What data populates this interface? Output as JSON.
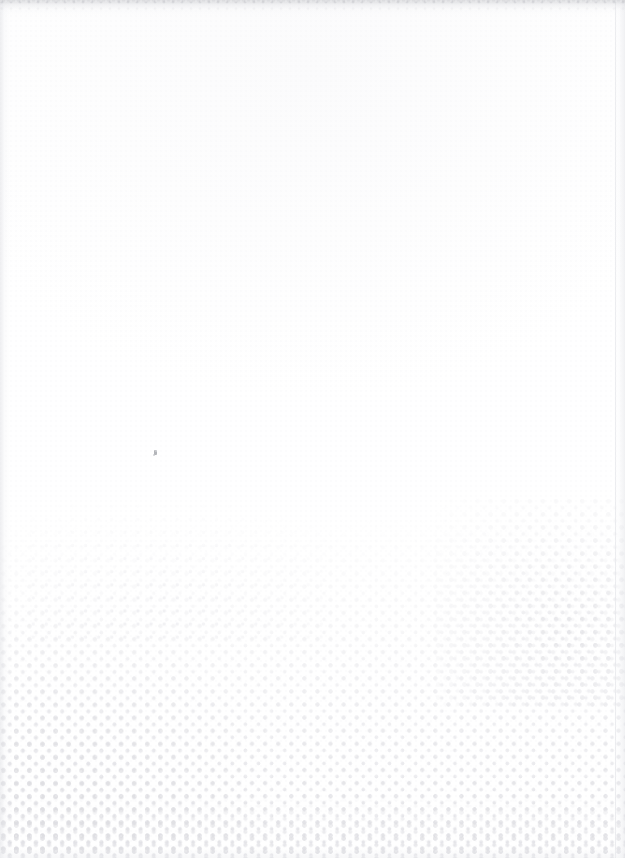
{
  "page": {
    "kind": "scanned-blank-page",
    "width_px": 625,
    "height_px": 858,
    "background_color": "#ffffff",
    "visible_text": "",
    "caption": ""
  },
  "artifacts": {
    "top_edge": {
      "name": "scan-edge-shadow-top",
      "color": "#c4c5c9",
      "height_px": 16
    },
    "left_edge": {
      "name": "scan-edge-shadow-left",
      "color": "#dedfe3",
      "width_px": 10
    },
    "right_edge": {
      "name": "scan-edge-shadow-right",
      "color": "#e2e3e7",
      "width_px": 12
    },
    "bottom_edge": {
      "name": "scan-edge-shadow-bottom",
      "color": "#ecedf0",
      "height_px": 10
    },
    "ink_speck": {
      "name": "ink-speck",
      "x_px": 154,
      "y_px": 450,
      "color": "#96989e"
    }
  },
  "halftone": {
    "name": "halftone-dot-field",
    "grid_pitch_px": 13.1,
    "arrangement": "staggered",
    "dot_color_light": "#e6e6ea",
    "dot_color_mid": "#e2e2e6",
    "dot_color_dark": "#dddde1",
    "field_top_y_px": 518,
    "field_bottom_y_px": 858,
    "clusters": [
      {
        "name": "halftone-cluster-left",
        "anchor": "bottom-left",
        "width_px": 250,
        "height_px": 300,
        "density": "high"
      },
      {
        "name": "halftone-cluster-right",
        "anchor": "right",
        "width_px": 190,
        "height_px": 210,
        "density": "medium"
      },
      {
        "name": "halftone-wisp-mid",
        "anchor": "center-left",
        "width_px": 300,
        "height_px": 140,
        "density": "low"
      },
      {
        "name": "halftone-bottom-band",
        "anchor": "bottom-full-width",
        "height_px": 62,
        "density": "high"
      }
    ]
  }
}
